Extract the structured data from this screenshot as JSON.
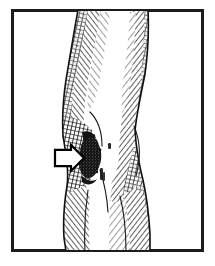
{
  "figure": {
    "title": "Leg with knee lesion",
    "domain_kind": "Natural-Image",
    "medium": "black and white pen-and-ink cross-hatch line illustration",
    "background_color": "#ffffff",
    "ink_color": "#1a1a1a",
    "shading_color": "#3d3d3d",
    "lesion_color": "#111111",
    "arrow_fill": "#ffffff",
    "arrow_outline": "#000000",
    "canvas": {
      "width": 215,
      "height": 266
    }
  },
  "frame": {
    "label": "illustration border",
    "x": 11,
    "y": 9,
    "width": 193,
    "height": 243,
    "stroke_color": "#1c1c1c",
    "stroke_width": 3,
    "fill": "#ffffff"
  },
  "annotations": {
    "arrow": {
      "label": "pointer arrow indicating lesion",
      "shape": "block arrow",
      "direction": "right",
      "tip_x": 84,
      "tip_y": 158,
      "tail_x": 55,
      "tail_y": 158,
      "width": 29,
      "height": 26,
      "fill": "#ffffff",
      "outline": "#000000",
      "outline_width": 2.2
    },
    "lesion": {
      "label": "dark ulcerated lesion on medial knee",
      "center_x": 92,
      "center_y": 155,
      "width": 24,
      "height": 42,
      "tone": "dense black stipple"
    },
    "stipple_marks": [
      {
        "x": 108,
        "y": 143,
        "w": 3,
        "h": 6
      },
      {
        "x": 100,
        "y": 168,
        "w": 3,
        "h": 12
      },
      {
        "x": 103,
        "y": 172,
        "w": 2,
        "h": 9
      }
    ]
  },
  "anatomy": {
    "regions": [
      {
        "name": "thigh",
        "y_from": 10,
        "y_to": 95,
        "note": "widest at top, tapering downward"
      },
      {
        "name": "knee",
        "y_from": 95,
        "y_to": 175,
        "note": "narrowest waist, patella highlight center"
      },
      {
        "name": "calf",
        "y_from": 175,
        "y_to": 251,
        "note": "widening again toward lower edge"
      }
    ],
    "outline_left": [
      [
        78,
        10
      ],
      [
        74,
        32
      ],
      [
        70,
        56
      ],
      [
        66,
        80
      ],
      [
        63,
        100
      ],
      [
        62,
        118
      ],
      [
        63,
        136
      ],
      [
        66,
        154
      ],
      [
        69,
        170
      ],
      [
        67,
        186
      ],
      [
        64,
        204
      ],
      [
        63,
        222
      ],
      [
        64,
        238
      ],
      [
        66,
        251
      ]
    ],
    "outline_right": [
      [
        148,
        10
      ],
      [
        149,
        30
      ],
      [
        148,
        52
      ],
      [
        145,
        74
      ],
      [
        141,
        94
      ],
      [
        137,
        112
      ],
      [
        135,
        130
      ],
      [
        136,
        148
      ],
      [
        139,
        164
      ],
      [
        143,
        180
      ],
      [
        147,
        198
      ],
      [
        149,
        216
      ],
      [
        150,
        234
      ],
      [
        150,
        251
      ]
    ],
    "highlight_midline": [
      [
        112,
        14
      ],
      [
        108,
        44
      ],
      [
        104,
        74
      ],
      [
        100,
        102
      ],
      [
        98,
        126
      ],
      [
        99,
        150
      ],
      [
        103,
        176
      ],
      [
        106,
        202
      ],
      [
        107,
        226
      ],
      [
        107,
        251
      ]
    ]
  },
  "hatching": {
    "style": "parallel diagonal pen strokes and cross-hatching",
    "left_band": {
      "label": "left margin shading band",
      "angle_deg": -38,
      "density": "dense"
    },
    "right_band": {
      "label": "right margin shading band",
      "angle_deg": 38,
      "density": "dense"
    },
    "knee_fold": {
      "label": "popliteal/knee fold cross-hatch",
      "angle_deg": 10,
      "density": "very dense"
    }
  },
  "accessibility": {
    "alt_text": "Black and white cross-hatched ink drawing of a human leg seen from mid-thigh to calf. A dark irregular lesion sits on the inner side of the knee and a white block arrow on the left points directly at it. The drawing is enclosed by a thin dark rectangular border."
  }
}
